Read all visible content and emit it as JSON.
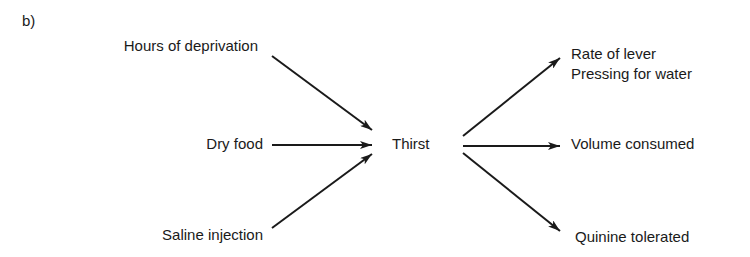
{
  "panel_label": "b)",
  "inputs": [
    {
      "label": "Hours of deprivation"
    },
    {
      "label": "Dry food"
    },
    {
      "label": "Saline injection"
    }
  ],
  "center": {
    "label": "Thirst"
  },
  "outputs": [
    {
      "label_line1": "Rate of lever",
      "label_line2": "Pressing for water"
    },
    {
      "label": "Volume consumed"
    },
    {
      "label": "Quinine tolerated"
    }
  ],
  "colors": {
    "ink": "#1a1a1a",
    "background": "#ffffff"
  }
}
